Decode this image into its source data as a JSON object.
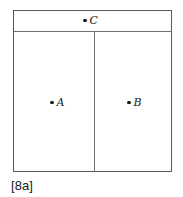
{
  "figure": {
    "caption": "[8a]",
    "colors": {
      "background": "#ffffff",
      "border": "#555a5e",
      "divider": "#6b7074",
      "marker": "#15181a",
      "text": "#15181a"
    },
    "regions": [
      {
        "id": "top-strip",
        "name": "top region"
      },
      {
        "id": "room-left",
        "name": "left room"
      },
      {
        "id": "room-right",
        "name": "right room"
      }
    ],
    "points": [
      {
        "id": "c",
        "label": "C",
        "marker": "dot",
        "region": "top-strip"
      },
      {
        "id": "a",
        "label": "A",
        "marker": "dot",
        "region": "room-left"
      },
      {
        "id": "b",
        "label": "B",
        "marker": "dot",
        "region": "room-right"
      }
    ]
  }
}
